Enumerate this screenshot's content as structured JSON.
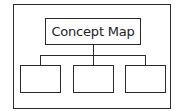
{
  "diagram": {
    "title": "Concept Map",
    "children": [
      {
        "label": ""
      },
      {
        "label": ""
      },
      {
        "label": ""
      }
    ],
    "colors": {
      "stroke": "#2a2a2a",
      "background": "#ffffff",
      "text": "#222222"
    }
  }
}
